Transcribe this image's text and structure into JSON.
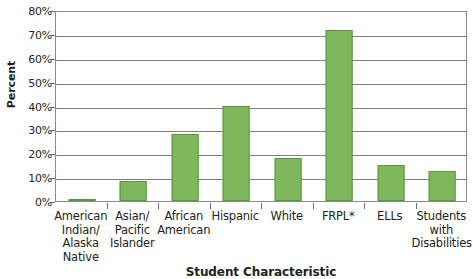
{
  "chart_data": {
    "type": "bar",
    "title": "",
    "xlabel": "Student Characteristic",
    "ylabel": "Percent",
    "ylim": [
      0,
      80
    ],
    "ytick_step": 10,
    "grid": true,
    "legend": "none",
    "orientation": "vertical",
    "bar_color": "#7fb85c",
    "bar_border_color": "#5e9441",
    "categories": [
      "American Indian/ Alaska Native",
      "Asian/ Pacific Islander",
      "African American",
      "Hispanic",
      "White",
      "FRPL*",
      "ELLs",
      "Students with Disabilities"
    ],
    "values": [
      1,
      8.5,
      28,
      40,
      18,
      71.5,
      15,
      12.5
    ],
    "ytick_labels": [
      "0%",
      "10%",
      "20%",
      "30%",
      "40%",
      "50%",
      "60%",
      "70%",
      "80%"
    ],
    "ytick_values": [
      0,
      10,
      20,
      30,
      40,
      50,
      60,
      70,
      80
    ]
  },
  "axes": {
    "y_title": "Percent",
    "x_title": "Student Characteristic"
  },
  "category_labels": [
    {
      "lines": [
        "American",
        "Indian/",
        "Alaska",
        "Native"
      ]
    },
    {
      "lines": [
        "Asian/",
        "Pacific",
        "Islander"
      ]
    },
    {
      "lines": [
        "African",
        "American"
      ]
    },
    {
      "lines": [
        "Hispanic"
      ]
    },
    {
      "lines": [
        "White"
      ]
    },
    {
      "lines": [
        "FRPL*"
      ]
    },
    {
      "lines": [
        "ELLs"
      ]
    },
    {
      "lines": [
        "Students",
        "with",
        "Disabilities"
      ]
    }
  ]
}
